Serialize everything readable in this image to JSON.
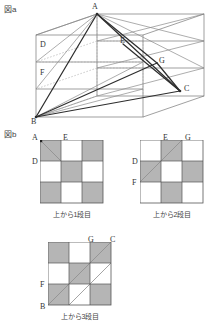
{
  "figure_a": {
    "label": "図a",
    "vertices": [
      {
        "name": "A",
        "x": 97,
        "y": 14
      },
      {
        "name": "E",
        "x": 123,
        "y": 44
      },
      {
        "name": "G",
        "x": 157,
        "y": 63
      },
      {
        "name": "C",
        "x": 180,
        "y": 91
      },
      {
        "name": "D",
        "x": 46,
        "y": 48
      },
      {
        "name": "F",
        "x": 46,
        "y": 75
      },
      {
        "name": "B",
        "x": 36,
        "y": 117
      }
    ],
    "description": "cube drawn in oblique projection divided into 3 layers with diagonals A-B, A-C, B-C, A-G, B-G, E-C"
  },
  "figure_b": {
    "label": "図b",
    "grids": [
      {
        "caption": "上から1段目",
        "corner_labels": [
          {
            "name": "A",
            "pos": "top-left"
          },
          {
            "name": "E",
            "pos": "top-mid"
          },
          {
            "name": "D",
            "pos": "left-mid"
          }
        ],
        "shaded": [
          [
            1,
            0,
            1
          ],
          [
            0,
            1,
            0
          ],
          [
            1,
            0,
            1
          ]
        ],
        "diagonal": {
          "from": "A",
          "to": "E",
          "cells": "top-left-cell"
        }
      },
      {
        "caption": "上から2段目",
        "corner_labels": [
          {
            "name": "E",
            "pos": "top-mid"
          },
          {
            "name": "G",
            "pos": "top-right"
          },
          {
            "name": "D",
            "pos": "left-top"
          },
          {
            "name": "F",
            "pos": "left-mid"
          }
        ],
        "shaded": [
          [
            0,
            1,
            0
          ],
          [
            1,
            0,
            1
          ],
          [
            0,
            1,
            0
          ]
        ],
        "diagonal": {
          "from": "D",
          "to": "E",
          "cells": "anti-diagonal"
        }
      },
      {
        "caption": "上から3段目",
        "corner_labels": [
          {
            "name": "G",
            "pos": "top-mid"
          },
          {
            "name": "C",
            "pos": "top-right"
          },
          {
            "name": "F",
            "pos": "left-mid"
          },
          {
            "name": "B",
            "pos": "bottom-left"
          }
        ],
        "shaded": [
          [
            1,
            0,
            1
          ],
          [
            0,
            1,
            0
          ],
          [
            1,
            0,
            1
          ]
        ],
        "diagonal": {
          "from": "B",
          "to": "C",
          "cells": "main-diagonal"
        }
      }
    ]
  },
  "colors": {
    "shade": "#b5b5b5",
    "line": "#555555",
    "dotted": "#999999",
    "heavy": "#333333",
    "text": "#333333"
  }
}
